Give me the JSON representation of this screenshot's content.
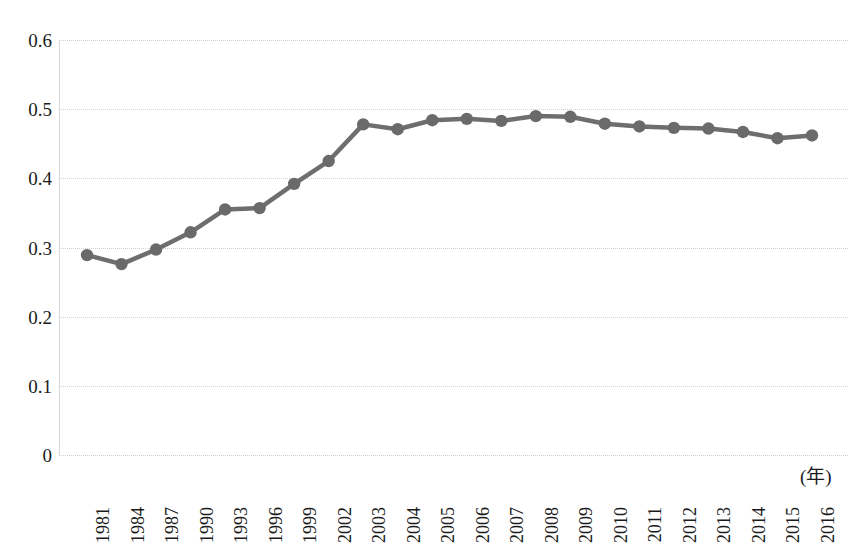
{
  "chart_data": {
    "type": "line",
    "title": "",
    "subtitle": "",
    "xlabel": "(年)",
    "ylabel": "",
    "grid": true,
    "legend": false,
    "legend_position": "none",
    "xlim_categories": true,
    "ylim": [
      0,
      0.6
    ],
    "ytick_labels": [
      "0.6",
      "0.5",
      "0.4",
      "0.3",
      "0.2",
      "0.1",
      "0"
    ],
    "ytick_values": [
      0.6,
      0.5,
      0.4,
      0.3,
      0.2,
      0.1,
      0
    ],
    "categories": [
      "1981",
      "1984",
      "1987",
      "1990",
      "1993",
      "1996",
      "1999",
      "2002",
      "2003",
      "2004",
      "2005",
      "2006",
      "2007",
      "2008",
      "2009",
      "2010",
      "2011",
      "2012",
      "2013",
      "2014",
      "2015",
      "2016"
    ],
    "values": [
      0.289,
      0.276,
      0.297,
      0.322,
      0.355,
      0.357,
      0.392,
      0.425,
      0.478,
      0.471,
      0.484,
      0.486,
      0.483,
      0.49,
      0.489,
      0.479,
      0.475,
      0.473,
      0.472,
      0.467,
      0.458,
      0.462
    ],
    "series": [
      {
        "name": "series-1",
        "color": "#6e6e6e",
        "marker": "circle",
        "values": [
          0.289,
          0.276,
          0.297,
          0.322,
          0.355,
          0.357,
          0.392,
          0.425,
          0.478,
          0.471,
          0.484,
          0.486,
          0.483,
          0.49,
          0.489,
          0.479,
          0.475,
          0.473,
          0.472,
          0.467,
          0.458,
          0.462
        ]
      }
    ]
  },
  "colors": {
    "line": "#6e6e6e",
    "marker": "#6a6a6a",
    "gridline": "#cfcfd4",
    "axis": "#d5d5da",
    "text": "#1b1b1b",
    "background": "#ffffff"
  },
  "axis": {
    "x_unit_label": "(年)"
  }
}
